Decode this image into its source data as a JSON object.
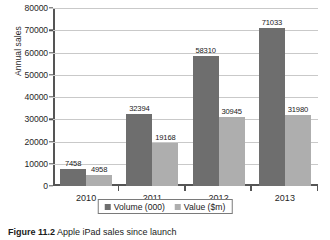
{
  "chart_data": {
    "type": "bar",
    "title": "",
    "xlabel": "",
    "ylabel": "Annual sales",
    "categories": [
      "2010",
      "2011",
      "2012",
      "2013"
    ],
    "series": [
      {
        "name": "Volume (000)",
        "color": "#6e6e6e",
        "values": [
          7458,
          32394,
          58310,
          71033
        ]
      },
      {
        "name": "Value ($m)",
        "color": "#aeaeae",
        "values": [
          4958,
          19168,
          30945,
          31980
        ]
      }
    ],
    "ylim": [
      0,
      80000
    ],
    "ytick_labels": [
      "80000",
      "70000",
      "60000",
      "50000",
      "40000",
      "30000",
      "20000",
      "10000",
      "0"
    ],
    "ytick_values": [
      80000,
      70000,
      60000,
      50000,
      40000,
      30000,
      20000,
      10000,
      0
    ],
    "grid": true,
    "legend_position": "bottom",
    "data_labels": [
      [
        "7458",
        "32394",
        "58310",
        "71033"
      ],
      [
        "4958",
        "19168",
        "30945",
        "31980"
      ]
    ]
  },
  "caption": {
    "number": "Figure 11.2",
    "text": "Apple iPad sales since launch"
  }
}
